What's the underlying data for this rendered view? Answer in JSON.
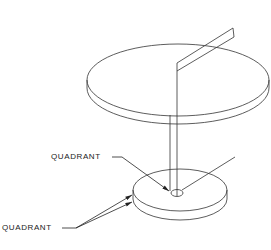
{
  "diagram": {
    "type": "isometric-technical-drawing",
    "labels": [
      {
        "id": "quadrant-upper",
        "text": "QUADRANT",
        "target": "center of lower disc"
      },
      {
        "id": "quadrant-lower",
        "text": "QUADRANT",
        "target": "left edge of lower disc (top and bottom rims)"
      }
    ],
    "components": {
      "upper_disc": {
        "shape": "ellipse-cylinder",
        "cx": 178,
        "cy": 83,
        "rx": 92,
        "ry": 38,
        "thickness": 9
      },
      "radial_plane": {
        "from": [
          177,
          63
        ],
        "to": [
          233,
          28
        ]
      },
      "shaft": {
        "lines_x": [
          170,
          177
        ],
        "y_top": 105,
        "y_bottom": 192
      },
      "lower_disc": {
        "shape": "ellipse-cylinder",
        "cx": 178,
        "cy": 190,
        "rx": 48,
        "ry": 22,
        "thickness": 11
      },
      "center_hole": {
        "cx": 177,
        "cy": 193,
        "rx": 6,
        "ry": 3.5
      },
      "axis_line": {
        "from": [
          182,
          191
        ],
        "to": [
          235,
          158
        ]
      }
    },
    "colors": {
      "line": "#333333",
      "background": "#ffffff"
    }
  }
}
